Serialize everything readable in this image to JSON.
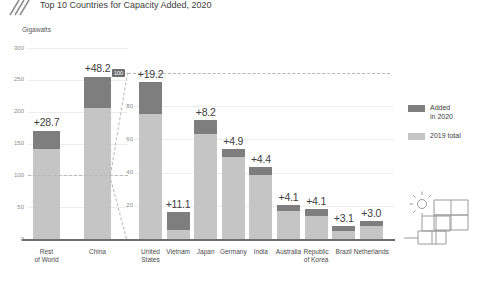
{
  "header": {
    "logo_icon": "diagonal-hatch-logo",
    "title_top_clipped": "Solar PV Capacity Additions",
    "title": "Top 10 Countries for Capacity Added, 2020"
  },
  "units_label": "Gigawatts",
  "legend": {
    "items": [
      {
        "label_line1": "Added",
        "label_line2": "in 2020",
        "color": "#7e7e7e",
        "key": "added_2020"
      },
      {
        "label_line1": "2019 total",
        "label_line2": "",
        "color": "#c5c5c5",
        "key": "total_2019"
      }
    ]
  },
  "decor": {
    "solar_icon": "solar-panel-sun-icon"
  },
  "colors": {
    "added_2020": "#7e7e7e",
    "total_2019": "#c5c5c5",
    "grid": "#ededed",
    "baseline": "#6e6e6e",
    "text": "#3d3d3d",
    "axis_text": "#8a8a8a",
    "callout_dash": "#b8b8b8"
  },
  "chart_data": {
    "type": "bar",
    "title": "Top 10 Countries for Capacity Added, 2020",
    "subtitle": "Solar PV Capacity Additions",
    "ylabel": "Gigawatts",
    "xlabel": "",
    "stacked": true,
    "grid": true,
    "legend_position": "right",
    "series": [
      {
        "name": "2019 total",
        "color": "#c5c5c5"
      },
      {
        "name": "Added in 2020",
        "color": "#7e7e7e"
      }
    ],
    "panels": [
      {
        "name": "overview-panel",
        "ylim": [
          0,
          300
        ],
        "yticks": [
          0,
          50,
          100,
          150,
          200,
          250,
          300
        ],
        "ytick_labels": [
          "0",
          "50",
          "100",
          "150",
          "200",
          "250",
          "300"
        ],
        "categories": [
          "Rest of World",
          "China"
        ],
        "category_lines": [
          [
            "Rest",
            "of World"
          ],
          [
            "China",
            ""
          ]
        ],
        "total_2019": [
          141.3,
          205.8
        ],
        "added_2020": [
          28.7,
          48.2
        ],
        "totals": [
          170.0,
          254.0
        ],
        "value_labels": [
          "+28.7",
          "+48.2"
        ]
      },
      {
        "name": "detail-panel",
        "ylim": [
          0,
          100
        ],
        "yticks": [
          20,
          40,
          60,
          80,
          100
        ],
        "ytick_labels": [
          "20",
          "40",
          "60",
          "80",
          "100"
        ],
        "highlighted_ytick": "100",
        "categories": [
          "United States",
          "Vietnam",
          "Japan",
          "Germany",
          "India",
          "Australia",
          "Republic of Korea",
          "Brazil",
          "Netherlands"
        ],
        "category_lines": [
          [
            "United",
            "States"
          ],
          [
            "Vietnam",
            ""
          ],
          [
            "Japan",
            ""
          ],
          [
            "Germany",
            ""
          ],
          [
            "India",
            ""
          ],
          [
            "Australia",
            ""
          ],
          [
            "Republic",
            "of Korea"
          ],
          [
            "Brazil",
            ""
          ],
          [
            "Netherlands",
            ""
          ]
        ],
        "total_2019": [
          75.6,
          5.4,
          63.2,
          49.2,
          38.8,
          16.6,
          13.7,
          4.6,
          7.7
        ],
        "added_2020": [
          19.2,
          11.1,
          8.2,
          4.9,
          4.4,
          4.1,
          4.1,
          3.1,
          3.0
        ],
        "totals": [
          94.8,
          16.5,
          71.4,
          54.1,
          43.2,
          20.7,
          17.8,
          7.7,
          10.7
        ],
        "value_labels": [
          "+19.2",
          "+11.1",
          "+8.2",
          "+4.9",
          "+4.4",
          "+4.1",
          "+4.1",
          "+3.1",
          "+3.0"
        ]
      }
    ]
  }
}
